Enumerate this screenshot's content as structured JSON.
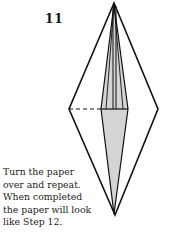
{
  "step": {
    "number": "11"
  },
  "diagram": {
    "outline_color": "#111111",
    "fill_color": "#d4d4d4",
    "background": "#ffffff"
  },
  "instructions": {
    "lines": [
      "Turn the paper",
      "over and repeat.",
      "When completed",
      "the paper will look",
      "like Step 12."
    ]
  }
}
